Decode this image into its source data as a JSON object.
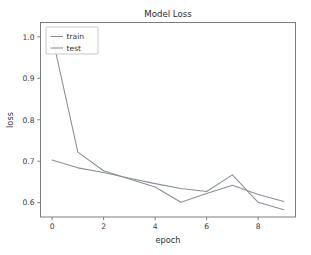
{
  "chart_data": {
    "type": "line",
    "title": "Model Loss",
    "xlabel": "epoch",
    "ylabel": "loss",
    "x": [
      0,
      1,
      2,
      3,
      4,
      5,
      6,
      7,
      8,
      9
    ],
    "xlim": [
      -0.45,
      9.45
    ],
    "ylim": [
      0.5655,
      1.0345
    ],
    "xticks": [
      0,
      2,
      4,
      6,
      8
    ],
    "xticklabels": [
      "0",
      "2",
      "4",
      "6",
      "8"
    ],
    "yticks": [
      0.6,
      0.7,
      0.8,
      0.9,
      1.0
    ],
    "yticklabels": [
      "0.6",
      "0.7",
      "0.8",
      "0.9",
      "1.0"
    ],
    "grid": false,
    "legend_position": "upper left",
    "series": [
      {
        "name": "train",
        "color": "#8a8f96",
        "values": [
          1.003,
          0.722,
          0.677,
          0.657,
          0.638,
          0.601,
          0.622,
          0.642,
          0.62,
          0.603
        ]
      },
      {
        "name": "test",
        "color": "#8a8f96",
        "values": [
          0.703,
          0.684,
          0.673,
          0.659,
          0.646,
          0.634,
          0.627,
          0.667,
          0.601,
          0.583
        ]
      }
    ]
  },
  "figure": {
    "background_color": "#ffffff",
    "axes_edge_color": "#6f6f6f",
    "tick_label_color": "#3d3d3d"
  },
  "legend": {
    "entries": [
      "train",
      "test"
    ]
  }
}
